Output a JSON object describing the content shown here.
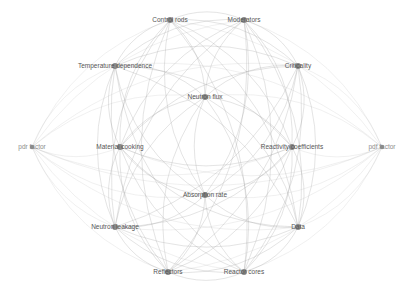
{
  "diagram": {
    "type": "network-graph",
    "background": "#ffffff",
    "node_color": "#8a8a8a",
    "edge_color": "#9a9a9a",
    "label_color": "#555555",
    "nodes": [
      {
        "id": "control_rods",
        "label": "Control rods",
        "x": 170,
        "y": 20
      },
      {
        "id": "moderators",
        "label": "Moderators",
        "x": 244,
        "y": 20
      },
      {
        "id": "temperature_dependence",
        "label": "Temperature dependence",
        "x": 115,
        "y": 66
      },
      {
        "id": "criticality",
        "label": "Criticality",
        "x": 298,
        "y": 66
      },
      {
        "id": "neutron_flux",
        "label": "Neutron flux",
        "x": 205,
        "y": 97
      },
      {
        "id": "pdr_factor",
        "label": "pdr factor",
        "x": 32,
        "y": 147,
        "faint": true
      },
      {
        "id": "material_cooking",
        "label": "Material cooking",
        "x": 120,
        "y": 147
      },
      {
        "id": "reactivity_coefficients",
        "label": "Reactivity coefficients",
        "x": 292,
        "y": 147
      },
      {
        "id": "pdf_factor",
        "label": "pdf factor",
        "x": 382,
        "y": 147,
        "faint": true
      },
      {
        "id": "absorption_rate",
        "label": "Absorption rate",
        "x": 205,
        "y": 195
      },
      {
        "id": "neutron_leakage",
        "label": "Neutron leakage",
        "x": 115,
        "y": 227
      },
      {
        "id": "data",
        "label": "Data",
        "x": 298,
        "y": 227
      },
      {
        "id": "reflectors",
        "label": "Reflectors",
        "x": 168,
        "y": 272
      },
      {
        "id": "reactor_cores",
        "label": "Reactor cores",
        "x": 244,
        "y": 272
      }
    ]
  }
}
